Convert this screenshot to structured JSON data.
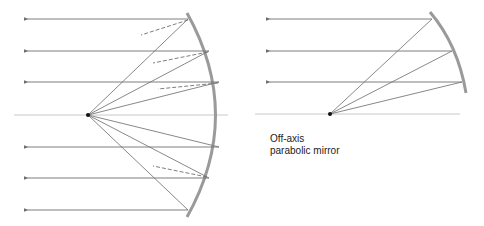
{
  "figure": {
    "left_diagram": {
      "name": "on-axis parabolic mirror",
      "focus": [
        88,
        115
      ],
      "axis_y": 115,
      "ray_heights": [
        19,
        51,
        82,
        147,
        178,
        210
      ]
    },
    "right_diagram": {
      "focus": [
        330,
        114
      ],
      "axis_y": 114,
      "ray_heights": [
        19,
        51,
        82
      ],
      "caption_line1": "Off-axis",
      "caption_line2": "parabolic mirror"
    },
    "colors": {
      "ray": "#6f6f6f",
      "mirror": "#9a9a9a",
      "axis": "#c8c8c8",
      "focus": "#111111"
    }
  }
}
